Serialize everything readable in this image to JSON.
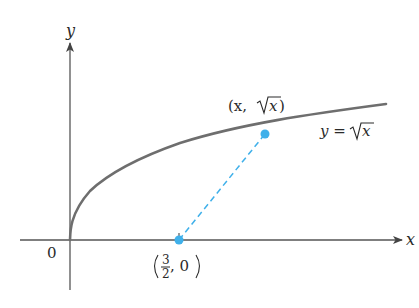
{
  "figure": {
    "axes": {
      "x_label": "x",
      "y_label": "y",
      "origin_label": "0"
    },
    "curve": {
      "equation_lhs": "y = ",
      "equation_rad": "x",
      "color": "#6e6e6e"
    },
    "points": [
      {
        "name": "curve-point",
        "label_open": "(x, ",
        "label_rad": "x",
        "label_close": ")",
        "color": "#3fb0ea"
      },
      {
        "name": "axis-point",
        "label_num": "3",
        "label_den": "2",
        "label_tail": ", 0",
        "color": "#3fb0ea"
      }
    ],
    "connector": {
      "style": "dashed",
      "color": "#3fb0ea"
    }
  }
}
